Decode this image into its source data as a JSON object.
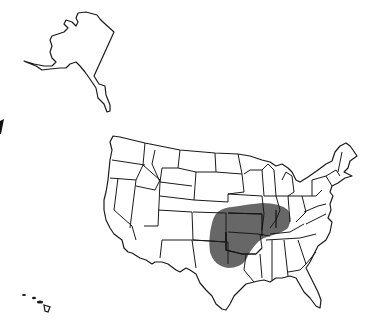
{
  "map": {
    "title": "",
    "type": "choropleth-region",
    "regions_shown": [
      "Alaska",
      "Hawaii",
      "Contiguous United States"
    ],
    "highlight": {
      "description": "Shaded region over central United States",
      "color": "#5a5a5a",
      "approx_states": [
        "Kansas",
        "Oklahoma",
        "Missouri",
        "Arkansas",
        "Iowa",
        "Illinois",
        "Indiana",
        "Kentucky",
        "Tennessee",
        "Nebraska"
      ]
    },
    "outline_color": "#1a1a1a",
    "background_color": "#ffffff",
    "legend": null
  }
}
